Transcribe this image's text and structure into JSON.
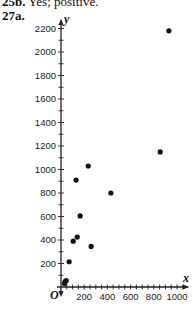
{
  "header": {
    "prev_answer_label": "25b.",
    "prev_answer_text": "Yes; positive.",
    "problem_label": "27a."
  },
  "chart_data": {
    "type": "scatter",
    "title": "",
    "xlabel": "x",
    "ylabel": "y",
    "origin_label": "O",
    "xlim": [
      0,
      1050
    ],
    "ylim": [
      0,
      2250
    ],
    "x_ticks": [
      200,
      400,
      600,
      800,
      1000
    ],
    "y_ticks": [
      200,
      400,
      600,
      800,
      1000,
      1200,
      1400,
      1600,
      1800,
      2000,
      2200
    ],
    "x_minor_step": 100,
    "y_minor_step": 100,
    "grid": false,
    "points": [
      {
        "x": 930,
        "y": 2180
      },
      {
        "x": 855,
        "y": 1150
      },
      {
        "x": 235,
        "y": 1030
      },
      {
        "x": 130,
        "y": 910
      },
      {
        "x": 430,
        "y": 800
      },
      {
        "x": 165,
        "y": 605
      },
      {
        "x": 140,
        "y": 425
      },
      {
        "x": 105,
        "y": 390
      },
      {
        "x": 260,
        "y": 345
      },
      {
        "x": 70,
        "y": 215
      },
      {
        "x": 35,
        "y": 45
      },
      {
        "x": 45,
        "y": 55
      },
      {
        "x": 30,
        "y": 30
      }
    ],
    "point_color": "#111111"
  }
}
